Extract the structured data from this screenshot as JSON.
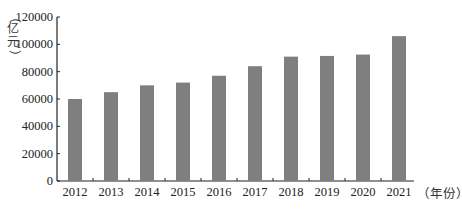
{
  "chart_data": {
    "type": "bar",
    "title": "",
    "xlabel": "（年份）",
    "ylabel": "（亿元）",
    "categories": [
      "2012",
      "2013",
      "2014",
      "2015",
      "2016",
      "2017",
      "2018",
      "2019",
      "2020",
      "2021"
    ],
    "series": [
      {
        "name": "",
        "values": [
          60000,
          65000,
          70000,
          72000,
          77000,
          84000,
          91000,
          91500,
          92500,
          106000
        ]
      }
    ],
    "ylim": [
      0,
      120000
    ],
    "yticks": [
      0,
      20000,
      40000,
      60000,
      80000,
      100000,
      120000
    ],
    "ytick_labels": [
      "0",
      "20000",
      "40000",
      "60000",
      "80000",
      "100000",
      "120000"
    ],
    "grid": false,
    "legend": "none",
    "bar_color": "#7f7f7f"
  },
  "labels": {
    "y_unit_chars": [
      "（",
      "亿",
      "元",
      "）"
    ],
    "x_unit": "（年份）"
  }
}
